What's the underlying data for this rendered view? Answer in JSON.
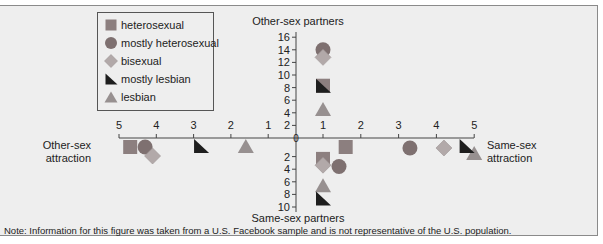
{
  "chart_data": {
    "type": "scatter",
    "title": "",
    "axes": {
      "top_label": "Other-sex partners",
      "bottom_label": "Same-sex partners",
      "left_label": [
        "Other-sex",
        "attraction"
      ],
      "right_label": [
        "Same-sex",
        "attraction"
      ],
      "top_ticks": [
        2,
        4,
        6,
        8,
        10,
        12,
        14,
        16
      ],
      "bottom_ticks": [
        2,
        4,
        6,
        8,
        10
      ],
      "left_ticks": [
        5,
        4,
        3,
        2,
        1
      ],
      "right_ticks": [
        1,
        2,
        3,
        4,
        5
      ],
      "origin_label": "0"
    },
    "legend": [
      {
        "name": "heterosexual",
        "shape": "square",
        "color": "#8c7f7f"
      },
      {
        "name": "mostly heterosexual",
        "shape": "circle",
        "color": "#7e7070"
      },
      {
        "name": "bisexual",
        "shape": "diamond",
        "color": "#b2a9a9"
      },
      {
        "name": "mostly lesbian",
        "shape": "half-triangle",
        "color": "#1e1e1e"
      },
      {
        "name": "lesbian",
        "shape": "triangle",
        "color": "#979090"
      }
    ],
    "series": [
      {
        "name": "heterosexual",
        "other_sex_partners": 8.3,
        "same_sex_partners": 3.0,
        "other_sex_attraction": 4.7,
        "same_sex_attraction": 1.6
      },
      {
        "name": "mostly heterosexual",
        "other_sex_partners": 14.0,
        "same_sex_partners": 4.2,
        "other_sex_attraction": 4.3,
        "same_sex_attraction": 3.3
      },
      {
        "name": "bisexual",
        "other_sex_partners": 12.8,
        "same_sex_partners": 4.0,
        "other_sex_attraction": 4.1,
        "same_sex_attraction": 4.2
      },
      {
        "name": "mostly lesbian",
        "other_sex_partners": 8.3,
        "same_sex_partners": 9.3,
        "other_sex_attraction": 2.8,
        "same_sex_attraction": 4.8
      },
      {
        "name": "lesbian",
        "other_sex_partners": 4.6,
        "same_sex_partners": 7.2,
        "other_sex_attraction": 1.6,
        "same_sex_attraction": 5.0
      }
    ],
    "grid": false,
    "legend_position": "top-left"
  },
  "note": "Note: Information for this figure was taken from a U.S. Facebook sample and is not representative of the U.S. population."
}
